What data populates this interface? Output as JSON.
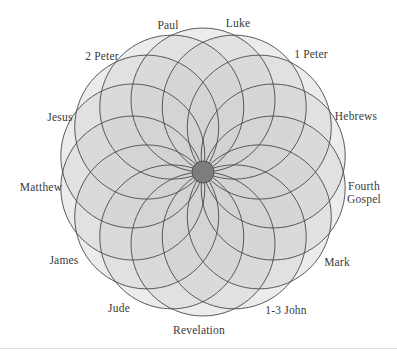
{
  "figure": {
    "name": "new-testament-rosette",
    "width": 397,
    "height": 351,
    "background_color": "#ffffff",
    "rule_color": "#e0e0e0"
  },
  "rosette": {
    "type": "overlapping-circle-rosette",
    "circle_count": 14,
    "center_x": 203,
    "center_y": 172,
    "petal_radius": 72,
    "outer_radius": 144,
    "hub_radius": 11,
    "start_angle_deg": -90,
    "stroke_color": "#4a4a4a",
    "stroke_width": 0.9,
    "fill_color": "#d2d2d2",
    "fill_opacity": 0.42,
    "hub_color": "#7d7d7d",
    "hub_stroke_color": "#4a4a4a"
  },
  "labels": [
    {
      "id": "paul",
      "text": "Paul",
      "x": 168,
      "y": 25,
      "align": "center"
    },
    {
      "id": "luke",
      "text": "Luke",
      "x": 238,
      "y": 23,
      "align": "center"
    },
    {
      "id": "2-peter",
      "text": "2 Peter",
      "x": 102,
      "y": 56,
      "align": "center"
    },
    {
      "id": "1-peter",
      "text": "1 Peter",
      "x": 311,
      "y": 54,
      "align": "center"
    },
    {
      "id": "jesus",
      "text": "Jesus",
      "x": 60,
      "y": 117,
      "align": "center"
    },
    {
      "id": "hebrews",
      "text": "Hebrews",
      "x": 356,
      "y": 116,
      "align": "center"
    },
    {
      "id": "matthew",
      "text": "Matthew",
      "x": 41,
      "y": 187,
      "align": "center"
    },
    {
      "id": "fourth-gospel",
      "text": "Fourth\nGospel",
      "x": 364,
      "y": 192,
      "align": "center"
    },
    {
      "id": "james",
      "text": "James",
      "x": 64,
      "y": 260,
      "align": "center"
    },
    {
      "id": "mark",
      "text": "Mark",
      "x": 337,
      "y": 262,
      "align": "center"
    },
    {
      "id": "jude",
      "text": "Jude",
      "x": 119,
      "y": 308,
      "align": "center"
    },
    {
      "id": "1-3-john",
      "text": "1-3 John",
      "x": 286,
      "y": 310,
      "align": "center"
    },
    {
      "id": "revelation",
      "text": "Revelation",
      "x": 199,
      "y": 330,
      "align": "center"
    }
  ],
  "chart_data": {
    "type": "diagram",
    "title": "",
    "subtitle": "",
    "categories": [
      "Paul",
      "Luke",
      "2 Peter",
      "1 Peter",
      "Jesus",
      "Hebrews",
      "Matthew",
      "Fourth Gospel",
      "James",
      "Mark",
      "Jude",
      "1-3 John",
      "Revelation"
    ],
    "values": [
      1,
      1,
      1,
      1,
      1,
      1,
      1,
      1,
      1,
      1,
      1,
      1,
      1
    ],
    "xlabel": "",
    "ylabel": "",
    "legend": [],
    "grid": false
  }
}
